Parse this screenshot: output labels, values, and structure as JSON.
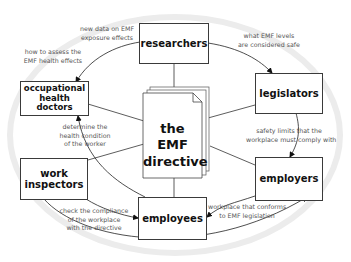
{
  "diagram": {
    "center": {
      "line1": "the EMF",
      "line2": "directive"
    },
    "nodes": {
      "researchers": {
        "label": "researchers"
      },
      "doctors": {
        "line1": "occupational",
        "line2": "health doctors"
      },
      "legislators": {
        "label": "legislators"
      },
      "inspectors": {
        "line1": "work",
        "line2": "inspectors"
      },
      "employers": {
        "label": "employers"
      },
      "employees": {
        "label": "employees"
      }
    },
    "edges": [
      {
        "from": "researchers",
        "to": "occupational health doctors",
        "lines": [
          "new data on EMF",
          "exposure effects"
        ]
      },
      {
        "from": "occupational health doctors",
        "to": "researchers",
        "lines": [
          "how to assess the",
          "EMF health effects"
        ]
      },
      {
        "from": "researchers",
        "to": "legislators",
        "lines": [
          "what EMF levels",
          "are considered safe"
        ]
      },
      {
        "from": "legislators",
        "to": "employers",
        "lines": [
          "safety limits that the",
          "workplace must comply with"
        ]
      },
      {
        "from": "employers",
        "to": "employees",
        "lines": [
          "workplace that conforms",
          "to EMF legislation"
        ]
      },
      {
        "from": "work inspectors",
        "to": "employees",
        "lines": [
          "check the compliance",
          "of the workplace",
          "with the directive"
        ]
      },
      {
        "from": "employees",
        "to": "occupational health doctors",
        "lines": [
          "determine the",
          "health condition",
          "of the worker"
        ]
      },
      {
        "from": "employers",
        "to": "work inspectors",
        "lines": []
      }
    ]
  }
}
